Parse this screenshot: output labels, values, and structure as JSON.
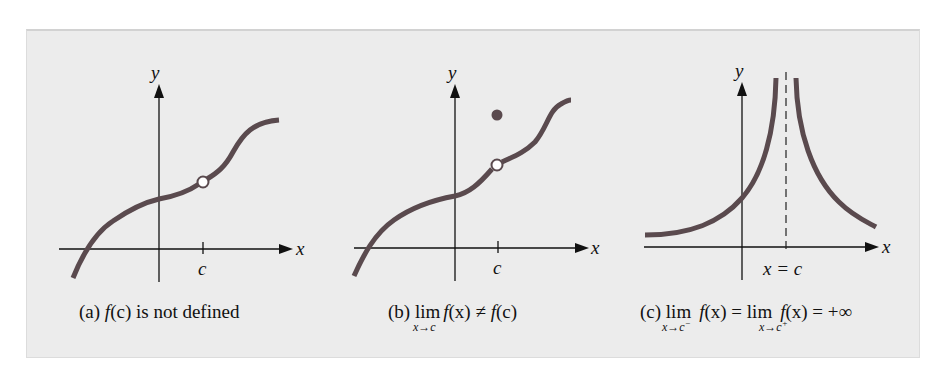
{
  "figure": {
    "colors": {
      "panel_background": "#ececec",
      "curve": "#5a4a4e",
      "axis": "#111111",
      "open_point_fill": "#ffffff"
    },
    "panels": [
      {
        "id": "a",
        "x_axis_label": "x",
        "y_axis_label": "y",
        "tick_label": "c",
        "caption": {
          "prefix": "(a) ",
          "f": "f",
          "arg": "(c)",
          "rest": " is not defined"
        },
        "features": [
          "continuous curve with open circle (hole) at x = c"
        ]
      },
      {
        "id": "b",
        "x_axis_label": "x",
        "y_axis_label": "y",
        "tick_label": "c",
        "caption": {
          "prefix": "(b) ",
          "lim": "lim",
          "lim_sub": "x→c",
          "f1": "f",
          "arg1": "(x) ≠ ",
          "f2": "f",
          "arg2": "(c)"
        },
        "features": [
          "open circle on curve at x = c",
          "filled point above curve at x = c"
        ]
      },
      {
        "id": "c",
        "x_axis_label": "x",
        "y_axis_label": "y",
        "asymptote_label": "x = c",
        "caption": {
          "prefix": "(c) ",
          "lim1": "lim",
          "lim1_sub": "x→c",
          "lim1_sup": "−",
          "f1": "f",
          "arg1": "(x) = ",
          "lim2": "lim",
          "lim2_sub": "x→c",
          "lim2_sup": "+",
          "f2": "f",
          "arg2": "(x) = +∞"
        },
        "features": [
          "vertical dashed asymptote at x = c",
          "both branches increase to +∞ near x = c"
        ]
      }
    ]
  }
}
